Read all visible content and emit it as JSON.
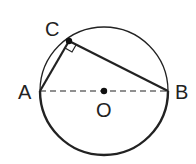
{
  "diagram": {
    "type": "geometry",
    "circle": {
      "center_label": "O",
      "cx": 104,
      "cy": 91,
      "r": 64
    },
    "points": {
      "A": {
        "label": "A",
        "x": 40,
        "y": 91
      },
      "B": {
        "label": "B",
        "x": 168,
        "y": 91
      },
      "C": {
        "label": "C",
        "x": 69,
        "y": 41
      },
      "O": {
        "label": "O",
        "x": 104,
        "y": 91
      }
    },
    "segments": [
      {
        "from": "A",
        "to": "C",
        "style": "solid"
      },
      {
        "from": "C",
        "to": "B",
        "style": "solid"
      },
      {
        "from": "A",
        "to": "B",
        "style": "dashed"
      }
    ],
    "right_angle_at": "C",
    "colors": {
      "stroke": "#222222",
      "background": "#ffffff"
    }
  }
}
